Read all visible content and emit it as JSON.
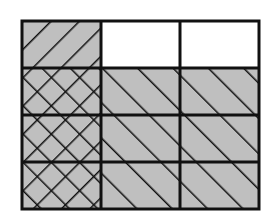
{
  "diagram": {
    "type": "fraction-area-model",
    "grid": {
      "columns": 3,
      "rows": 4
    },
    "colors": {
      "shade": "#bfbfbf",
      "unshaded": "#ffffff",
      "line": "#111111"
    },
    "cells": [
      {
        "row": 0,
        "col": 0,
        "shaded": true,
        "hatch": "forward-diagonal"
      },
      {
        "row": 0,
        "col": 1,
        "shaded": false,
        "hatch": "none"
      },
      {
        "row": 0,
        "col": 2,
        "shaded": false,
        "hatch": "none"
      },
      {
        "row": 1,
        "col": 0,
        "shaded": true,
        "hatch": "cross-diagonal"
      },
      {
        "row": 1,
        "col": 1,
        "shaded": true,
        "hatch": "back-diagonal"
      },
      {
        "row": 1,
        "col": 2,
        "shaded": true,
        "hatch": "back-diagonal"
      },
      {
        "row": 2,
        "col": 0,
        "shaded": true,
        "hatch": "cross-diagonal"
      },
      {
        "row": 2,
        "col": 1,
        "shaded": true,
        "hatch": "back-diagonal"
      },
      {
        "row": 2,
        "col": 2,
        "shaded": true,
        "hatch": "back-diagonal"
      },
      {
        "row": 3,
        "col": 0,
        "shaded": true,
        "hatch": "cross-diagonal"
      },
      {
        "row": 3,
        "col": 1,
        "shaded": true,
        "hatch": "back-diagonal"
      },
      {
        "row": 3,
        "col": 2,
        "shaded": true,
        "hatch": "back-diagonal"
      }
    ],
    "summary": {
      "column_1_shaded": "1/3",
      "rows_2_to_4_shaded": "3/4",
      "overlap_cross_hatched": "3 of 12 parts"
    }
  }
}
